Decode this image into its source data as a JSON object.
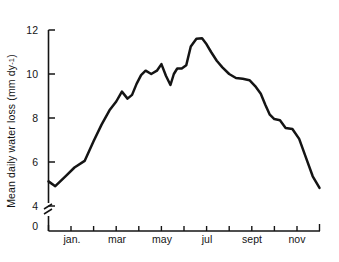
{
  "chart_data": {
    "type": "line",
    "title": "",
    "xlabel": "",
    "ylabel": "Mean daily water loss (mm dy",
    "ylabel_sup": "-1",
    "ylabel_close": ")",
    "ylim": [
      0,
      12
    ],
    "y_ticks": [
      "0",
      "4",
      "6",
      "8",
      "10",
      "12"
    ],
    "y_axis_break": true,
    "grid": false,
    "legend": null,
    "x_tick_labels": [
      "jan.",
      "mar",
      "may",
      "jul",
      "sept",
      "nov"
    ],
    "x_months": [
      "dec",
      "jan",
      "feb",
      "mar",
      "apr",
      "may",
      "jun",
      "jul",
      "aug",
      "sept",
      "oct",
      "nov",
      "dec"
    ],
    "x": [
      0.0,
      0.3,
      0.75,
      1.15,
      1.6,
      2.0,
      2.35,
      2.7,
      3.0,
      3.25,
      3.5,
      3.7,
      3.9,
      4.1,
      4.3,
      4.55,
      4.8,
      5.0,
      5.2,
      5.4,
      5.55,
      5.7,
      5.9,
      6.1,
      6.3,
      6.55,
      6.8,
      7.0,
      7.2,
      7.45,
      7.7,
      8.0,
      8.3,
      8.6,
      8.9,
      9.15,
      9.4,
      9.6,
      9.8,
      10.0,
      10.25,
      10.5,
      10.8,
      11.1,
      11.4,
      11.7,
      12.0
    ],
    "values": [
      5.12,
      4.9,
      5.35,
      5.75,
      6.05,
      6.95,
      7.7,
      8.35,
      8.75,
      9.2,
      8.88,
      9.05,
      9.55,
      9.95,
      10.15,
      10.0,
      10.15,
      10.45,
      9.92,
      9.5,
      10.0,
      10.25,
      10.25,
      10.4,
      11.25,
      11.6,
      11.62,
      11.35,
      11.0,
      10.6,
      10.3,
      10.0,
      9.82,
      9.78,
      9.72,
      9.45,
      9.1,
      8.6,
      8.15,
      7.95,
      7.9,
      7.55,
      7.5,
      7.05,
      6.2,
      5.35,
      4.82
    ],
    "line_color": "#141414",
    "background": "#ffffff"
  },
  "axes": {
    "y_tick_values": [
      0,
      4,
      6,
      8,
      10,
      12
    ],
    "x_tick_count": 13
  }
}
